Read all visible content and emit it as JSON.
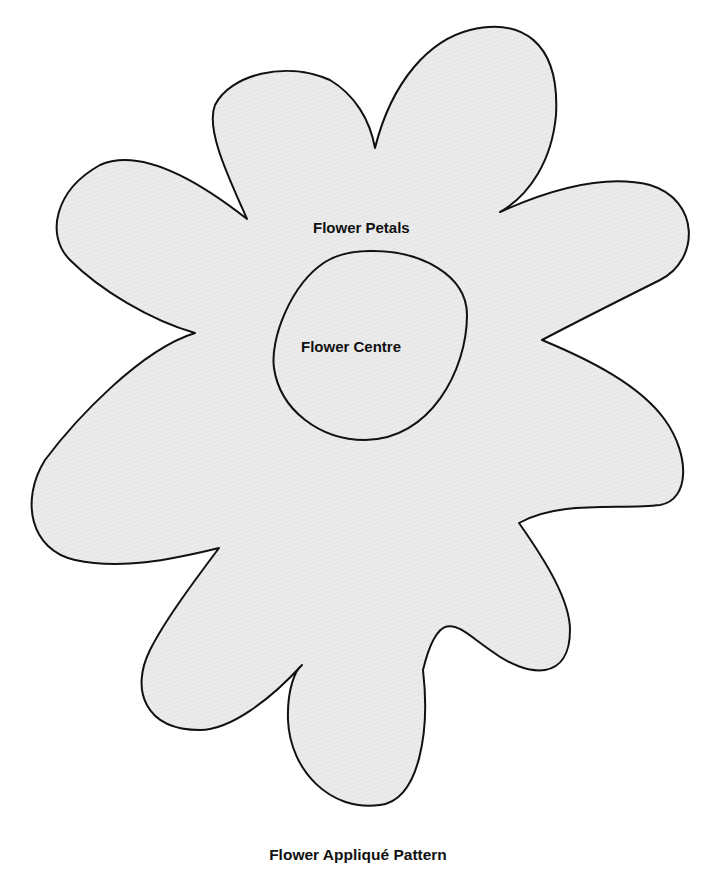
{
  "diagram": {
    "title": "Flower Appliqué Pattern",
    "pieces": [
      {
        "id": "petals",
        "label": "Flower Petals",
        "petal_count": 9
      },
      {
        "id": "centre",
        "label": "Flower Centre",
        "shape": "oval"
      }
    ]
  },
  "colors": {
    "fill": "#e9e9e9",
    "outline": "#111111",
    "background": "#ffffff",
    "text": "#111111"
  }
}
